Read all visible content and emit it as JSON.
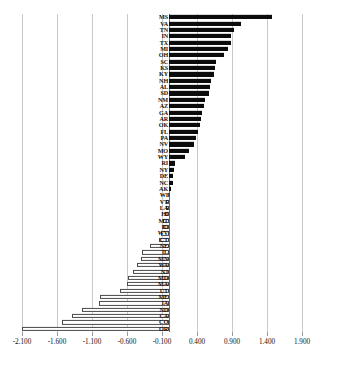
{
  "chart_data": {
    "type": "bar",
    "orientation": "horizontal",
    "title": "",
    "subtitle": "",
    "xlabel": "",
    "ylabel": "",
    "xlim": [
      -2.35,
      2.15
    ],
    "grid": true,
    "legend": null,
    "xticks": [
      -2.1,
      -1.6,
      -1.1,
      -0.6,
      -0.1,
      0.4,
      0.9,
      1.4,
      1.9
    ],
    "xticklabels": [
      "-2.100",
      "-1.600",
      "-1.100",
      "-0.600",
      "-0.100",
      "0.400",
      "0.900",
      "1.400",
      "1.900"
    ],
    "positive_color": "#0c0c0c",
    "negative_color": "#ffffff",
    "negative_edge_color": "#4a4a4a",
    "gridline_color": "#c9c9c9",
    "categories": [
      "MS",
      "VA",
      "TN",
      "IN",
      "TX",
      "MI",
      "OH",
      "SC",
      "KS",
      "KY",
      "NH",
      "AL",
      "SD",
      "NM",
      "AZ",
      "GA",
      "AR",
      "OK",
      "FL",
      "PA",
      "NV",
      "MO",
      "WY",
      "RI",
      "NY",
      "DE",
      "NC",
      "AK",
      "WI",
      "VT",
      "LA",
      "HI",
      "MT",
      "ID",
      "WV",
      "CT",
      "NE",
      "IL",
      "MN",
      "WA",
      "NJ",
      "MD",
      "MA",
      "UT",
      "ME",
      "IA",
      "ND",
      "CA",
      "CO",
      "OR"
    ],
    "values": [
      1.47,
      1.03,
      0.93,
      0.88,
      0.88,
      0.84,
      0.78,
      0.67,
      0.65,
      0.64,
      0.6,
      0.58,
      0.57,
      0.52,
      0.5,
      0.47,
      0.46,
      0.44,
      0.41,
      0.38,
      0.36,
      0.28,
      0.23,
      0.09,
      0.07,
      0.06,
      0.05,
      0.02,
      -0.02,
      -0.04,
      -0.05,
      -0.06,
      -0.08,
      -0.09,
      -0.11,
      -0.14,
      -0.27,
      -0.39,
      -0.4,
      -0.46,
      -0.51,
      -0.58,
      -0.6,
      -0.7,
      -0.98,
      -1.0,
      -1.25,
      -1.38,
      -1.53,
      -2.1
    ]
  }
}
